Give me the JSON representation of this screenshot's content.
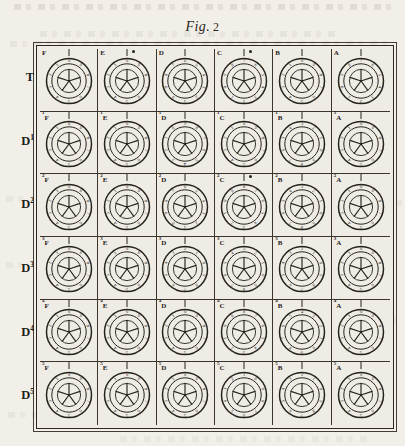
{
  "figure": {
    "label_italic": "Fig.",
    "label_number": "2",
    "caption": "Fig. 2"
  },
  "grid": {
    "rows": 6,
    "columns": 6,
    "row_labels": [
      {
        "base": "T",
        "sup": ""
      },
      {
        "base": "D",
        "sup": "1"
      },
      {
        "base": "D",
        "sup": "2"
      },
      {
        "base": "D",
        "sup": "3"
      },
      {
        "base": "D",
        "sup": "4"
      },
      {
        "base": "D",
        "sup": "5"
      }
    ],
    "column_labels": [
      "F",
      "E",
      "D",
      "C",
      "B",
      "A"
    ],
    "cells": [
      [
        {
          "letter": "F",
          "sup": "",
          "dot": false,
          "digits": [
            "0",
            "9",
            "8",
            "7",
            "6",
            "5",
            "4",
            "3",
            "2",
            "1"
          ]
        },
        {
          "letter": "E",
          "sup": "",
          "dot": true,
          "digits": [
            "0",
            "9",
            "8",
            "7",
            "6",
            "5",
            "4",
            "3",
            "2",
            "1"
          ]
        },
        {
          "letter": "D",
          "sup": "",
          "dot": false,
          "digits": [
            "6",
            "5",
            "4",
            "3",
            "2",
            "1",
            "0",
            "9",
            "8",
            "7"
          ]
        },
        {
          "letter": "C",
          "sup": "",
          "dot": true,
          "digits": [
            "7",
            "6",
            "5",
            "4",
            "3",
            "2",
            "1",
            "0",
            "9",
            "8"
          ]
        },
        {
          "letter": "B",
          "sup": "",
          "dot": false,
          "digits": [
            "0",
            "9",
            "8",
            "7",
            "6",
            "5",
            "4",
            "3",
            "2",
            "1"
          ]
        },
        {
          "letter": "A",
          "sup": "",
          "dot": false,
          "digits": [
            "7",
            "6",
            "5",
            "4",
            "3",
            "2",
            "1",
            "0",
            "9",
            "8"
          ]
        }
      ],
      [
        {
          "letter": "F",
          "sup": "1",
          "dot": false,
          "digits": [
            "0",
            "9",
            "8",
            "7",
            "6",
            "5",
            "4",
            "3",
            "2",
            "1"
          ]
        },
        {
          "letter": "E",
          "sup": "1",
          "dot": false,
          "digits": [
            "0",
            "9",
            "8",
            "7",
            "6",
            "5",
            "4",
            "3",
            "2",
            "1"
          ]
        },
        {
          "letter": "D",
          "sup": "1",
          "dot": false,
          "digits": [
            "9",
            "8",
            "7",
            "6",
            "5",
            "4",
            "3",
            "2",
            "1",
            "0"
          ]
        },
        {
          "letter": "C",
          "sup": "1",
          "dot": false,
          "digits": [
            "0",
            "9",
            "8",
            "7",
            "6",
            "5",
            "4",
            "3",
            "2",
            "1"
          ]
        },
        {
          "letter": "B",
          "sup": "1",
          "dot": false,
          "digits": [
            "3",
            "2",
            "1",
            "0",
            "9",
            "8",
            "7",
            "6",
            "5",
            "4"
          ]
        },
        {
          "letter": "A",
          "sup": "1",
          "dot": false,
          "digits": [
            "0",
            "9",
            "8",
            "7",
            "6",
            "5",
            "4",
            "3",
            "2",
            "1"
          ]
        }
      ],
      [
        {
          "letter": "F",
          "sup": "2",
          "dot": false,
          "digits": [
            "0",
            "9",
            "8",
            "7",
            "6",
            "5",
            "4",
            "3",
            "2",
            "1"
          ]
        },
        {
          "letter": "E",
          "sup": "2",
          "dot": false,
          "digits": [
            "0",
            "9",
            "8",
            "7",
            "6",
            "5",
            "4",
            "3",
            "2",
            "1"
          ]
        },
        {
          "letter": "D",
          "sup": "2",
          "dot": false,
          "digits": [
            "6",
            "5",
            "4",
            "3",
            "2",
            "1",
            "0",
            "9",
            "8",
            "7"
          ]
        },
        {
          "letter": "C",
          "sup": "2",
          "dot": true,
          "digits": [
            "8",
            "7",
            "6",
            "5",
            "4",
            "3",
            "2",
            "1",
            "0",
            "9"
          ]
        },
        {
          "letter": "B",
          "sup": "2",
          "dot": false,
          "digits": [
            "3",
            "2",
            "1",
            "0",
            "9",
            "8",
            "7",
            "6",
            "5",
            "4"
          ]
        },
        {
          "letter": "A",
          "sup": "2",
          "dot": false,
          "digits": [
            "0",
            "9",
            "8",
            "7",
            "6",
            "5",
            "4",
            "3",
            "2",
            "1"
          ]
        }
      ],
      [
        {
          "letter": "F",
          "sup": "3",
          "dot": false,
          "digits": [
            "0",
            "9",
            "8",
            "7",
            "6",
            "5",
            "4",
            "3",
            "2",
            "1"
          ]
        },
        {
          "letter": "E",
          "sup": "3",
          "dot": false,
          "digits": [
            "0",
            "9",
            "8",
            "7",
            "6",
            "5",
            "4",
            "3",
            "2",
            "1"
          ]
        },
        {
          "letter": "D",
          "sup": "3",
          "dot": false,
          "digits": [
            "2",
            "1",
            "0",
            "9",
            "8",
            "7",
            "6",
            "5",
            "4",
            "3"
          ]
        },
        {
          "letter": "C",
          "sup": "3",
          "dot": false,
          "digits": [
            "3",
            "2",
            "1",
            "0",
            "9",
            "8",
            "7",
            "6",
            "5",
            "4"
          ]
        },
        {
          "letter": "B",
          "sup": "3",
          "dot": false,
          "digits": [
            "2",
            "1",
            "0",
            "9",
            "8",
            "7",
            "6",
            "5",
            "4",
            "3"
          ]
        },
        {
          "letter": "A",
          "sup": "3",
          "dot": false,
          "digits": [
            "0",
            "9",
            "8",
            "7",
            "6",
            "5",
            "4",
            "3",
            "2",
            "1"
          ]
        }
      ],
      [
        {
          "letter": "F",
          "sup": "4",
          "dot": false,
          "digits": [
            "0",
            "9",
            "8",
            "7",
            "6",
            "5",
            "4",
            "3",
            "2",
            "1"
          ]
        },
        {
          "letter": "E",
          "sup": "4",
          "dot": false,
          "digits": [
            "0",
            "9",
            "8",
            "7",
            "6",
            "5",
            "4",
            "3",
            "2",
            "1"
          ]
        },
        {
          "letter": "D",
          "sup": "4",
          "dot": false,
          "digits": [
            "0",
            "9",
            "8",
            "7",
            "6",
            "5",
            "4",
            "3",
            "2",
            "1"
          ]
        },
        {
          "letter": "C",
          "sup": "4",
          "dot": false,
          "digits": [
            "8",
            "7",
            "6",
            "5",
            "4",
            "3",
            "2",
            "1",
            "0",
            "9"
          ]
        },
        {
          "letter": "B",
          "sup": "4",
          "dot": false,
          "digits": [
            "4",
            "3",
            "2",
            "1",
            "0",
            "9",
            "8",
            "7",
            "6",
            "5"
          ]
        },
        {
          "letter": "A",
          "sup": "4",
          "dot": false,
          "digits": [
            "0",
            "9",
            "8",
            "7",
            "6",
            "5",
            "4",
            "3",
            "2",
            "1"
          ]
        }
      ],
      [
        {
          "letter": "F",
          "sup": "5",
          "dot": false,
          "digits": [
            "0",
            "9",
            "8",
            "7",
            "6",
            "5",
            "4",
            "3",
            "2",
            "1"
          ]
        },
        {
          "letter": "E",
          "sup": "5",
          "dot": false,
          "digits": [
            "0",
            "9",
            "8",
            "7",
            "6",
            "5",
            "4",
            "3",
            "2",
            "1"
          ]
        },
        {
          "letter": "D",
          "sup": "5",
          "dot": false,
          "digits": [
            "0",
            "9",
            "8",
            "7",
            "6",
            "5",
            "4",
            "3",
            "2",
            "1"
          ]
        },
        {
          "letter": "C",
          "sup": "5",
          "dot": false,
          "digits": [
            "1",
            "0",
            "9",
            "8",
            "7",
            "6",
            "5",
            "4",
            "3",
            "2"
          ]
        },
        {
          "letter": "B",
          "sup": "5",
          "dot": false,
          "digits": [
            "2",
            "1",
            "0",
            "9",
            "8",
            "7",
            "6",
            "5",
            "4",
            "3"
          ]
        },
        {
          "letter": "A",
          "sup": "5",
          "dot": false,
          "digits": [
            "0",
            "9",
            "8",
            "7",
            "6",
            "5",
            "4",
            "3",
            "2",
            "1"
          ]
        }
      ]
    ]
  },
  "wheel": {
    "description": "numbered counter wheel",
    "spokes": 5,
    "digit_count": 10,
    "rim_digits": [
      "0",
      "1",
      "2",
      "3",
      "4",
      "5",
      "6",
      "7",
      "8",
      "9"
    ]
  },
  "colors": {
    "ink": "#26231d",
    "rule": "#3a362e",
    "paper": "#f2efe9",
    "plate": "#efece5"
  }
}
